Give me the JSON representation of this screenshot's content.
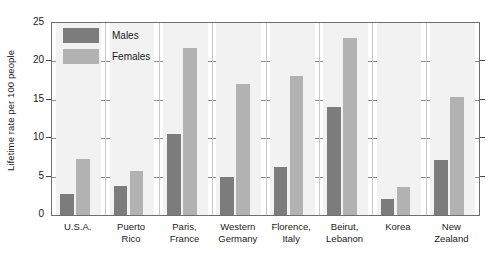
{
  "chart_data": {
    "type": "bar",
    "title": "",
    "xlabel": "",
    "ylabel": "Lifetime rate per 100 people",
    "ylim": [
      0,
      25
    ],
    "yticks": [
      0,
      5,
      10,
      15,
      20,
      25
    ],
    "grid": true,
    "legend_position": "top-left",
    "categories": [
      "U.S.A.",
      "Puerto Rico",
      "Paris, France",
      "Western Germany",
      "Florence, Italy",
      "Beirut, Lebanon",
      "Korea",
      "New Zealand"
    ],
    "category_lines": [
      [
        "U.S.A."
      ],
      [
        "Puerto",
        "Rico"
      ],
      [
        "Paris,",
        "France"
      ],
      [
        "Western",
        "Germany"
      ],
      [
        "Florence,",
        "Italy"
      ],
      [
        "Beirut,",
        "Lebanon"
      ],
      [
        "Korea"
      ],
      [
        "New",
        "Zealand"
      ]
    ],
    "series": [
      {
        "name": "Males",
        "color": "#7c7c7c",
        "values": [
          2.8,
          3.8,
          10.5,
          5.0,
          6.2,
          14.0,
          2.1,
          7.1
        ]
      },
      {
        "name": "Females",
        "color": "#b2b2b2",
        "values": [
          7.3,
          5.7,
          21.8,
          17.0,
          18.1,
          23.0,
          3.6,
          15.4
        ]
      }
    ]
  },
  "legend": {
    "males_label": "Males",
    "females_label": "Females"
  },
  "axis": {
    "y_title": "Lifetime rate per 100 people",
    "y_tick_labels": [
      "0",
      "5",
      "10",
      "15",
      "20",
      "25"
    ]
  }
}
